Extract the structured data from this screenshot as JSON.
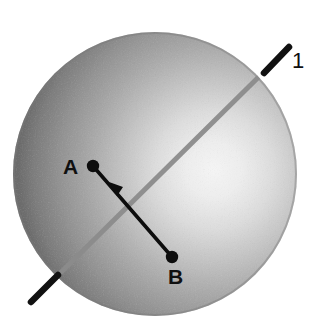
{
  "figure": {
    "width": 329,
    "height": 336,
    "background_color": "#ffffff"
  },
  "sphere": {
    "name": "shaded-sphere",
    "center_x": 155,
    "center_y": 174,
    "radius": 142,
    "highlight_x": 214,
    "highlight_y": 170,
    "highlight_color": "#f2f2f2",
    "mid_color": "#b4b4b4",
    "edge_color": "#6e6e6e"
  },
  "axis": {
    "name": "rotation-axis",
    "label": "1",
    "color_outside": "#111111",
    "color_inside": "#8a8a8a",
    "stroke_width_outside": 6,
    "stroke_width_inside": 5,
    "start_x": 32,
    "start_y": 301,
    "end_x": 289,
    "end_y": 47
  },
  "vector": {
    "name": "displacement-vector-AB",
    "color": "#0d0d0d",
    "stroke_width": 3.6,
    "dot_radius": 6,
    "from": {
      "label": "A",
      "x": 93,
      "y": 166,
      "label_x": 72,
      "label_y": 167
    },
    "to": {
      "label": "B",
      "x": 172,
      "y": 257,
      "label_x": 178,
      "label_y": 277
    },
    "arrow": {
      "x": 116,
      "y": 192,
      "size": 11
    }
  },
  "labels": {
    "point_a": "A",
    "point_b": "B",
    "axis_one": "1"
  }
}
